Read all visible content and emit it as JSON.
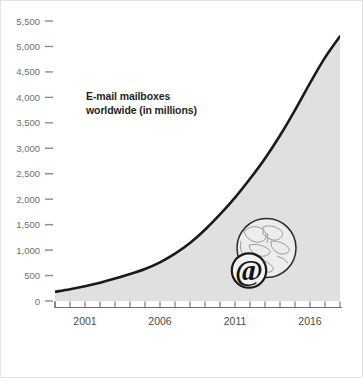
{
  "chart_data": {
    "type": "area",
    "title": "E-mail mailboxes worldwide (in millions)",
    "title_line1": "E-mail mailboxes",
    "title_line2": "worldwide (in millions)",
    "xlabel": "",
    "ylabel": "",
    "ylim": [
      0,
      5500
    ],
    "xlim": [
      1999,
      2018
    ],
    "grid": false,
    "legend": null,
    "y_ticks": [
      "0",
      "500",
      "1,000",
      "1,500",
      "2,000",
      "2,500",
      "3,000",
      "3,500",
      "4,000",
      "4,500",
      "5,000",
      "5,500"
    ],
    "y_tick_values": [
      0,
      500,
      1000,
      1500,
      2000,
      2500,
      3000,
      3500,
      4000,
      4500,
      5000,
      5500
    ],
    "x_tick_labels": [
      "2001",
      "2006",
      "2011",
      "2016"
    ],
    "x_tick_label_values": [
      2001,
      2006,
      2011,
      2016
    ],
    "x_minor_ticks": [
      1999,
      2000,
      2001,
      2002,
      2003,
      2004,
      2005,
      2006,
      2007,
      2008,
      2009,
      2010,
      2011,
      2012,
      2013,
      2014,
      2015,
      2016,
      2017,
      2018
    ],
    "x": [
      1999,
      2000,
      2001,
      2002,
      2003,
      2004,
      2005,
      2006,
      2007,
      2008,
      2009,
      2010,
      2011,
      2012,
      2013,
      2014,
      2015,
      2016,
      2017,
      2018
    ],
    "values": [
      180,
      230,
      290,
      360,
      440,
      530,
      630,
      760,
      930,
      1140,
      1400,
      1700,
      2030,
      2400,
      2800,
      3250,
      3750,
      4280,
      4780,
      5200
    ],
    "series": [
      {
        "name": "E-mail mailboxes worldwide (in millions)",
        "values": [
          180,
          230,
          290,
          360,
          440,
          530,
          630,
          760,
          930,
          1140,
          1400,
          1700,
          2030,
          2400,
          2800,
          3250,
          3750,
          4280,
          4780,
          5200
        ]
      }
    ],
    "annotations": [
      {
        "name": "globe-at-symbol",
        "symbol": "@",
        "x": 2012.5,
        "y": 900
      }
    ],
    "colors": {
      "line": "#1a1a1a",
      "area_fill": "#e0e0e0",
      "tick_label": "#6f6f6f",
      "axis": "#6d6d6d",
      "title_text": "#231f20",
      "card_border": "#e3e3e3",
      "background": "#ffffff"
    }
  },
  "annotation_glyph": "@"
}
